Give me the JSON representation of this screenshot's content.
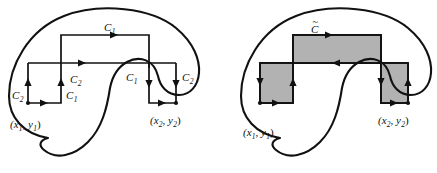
{
  "figure": {
    "width": 437,
    "height": 173,
    "background": "#ffffff",
    "stroke_color": "#111111",
    "shade_color": "#b2b2b2"
  },
  "panels": [
    {
      "id": "left-panel",
      "name": "unshaded-path-panel",
      "description": "Region with two piecewise paths C1 and C2 joining (x1,y1) to (x2,y2)",
      "labels": [
        {
          "id": "top-c1",
          "text": "C",
          "sub": "1",
          "x": 108,
          "y": 32,
          "name": "curve-label-c1-top"
        },
        {
          "id": "mid-c2",
          "text": "C",
          "sub": "2",
          "x": 74,
          "y": 80,
          "name": "curve-label-c2-middle"
        },
        {
          "id": "left-c2",
          "text": "C",
          "sub": "2",
          "x": 14,
          "y": 97,
          "name": "curve-label-c2-left"
        },
        {
          "id": "left-c1",
          "text": "C",
          "sub": "1",
          "x": 61,
          "y": 97,
          "name": "curve-label-c1-left"
        },
        {
          "id": "right-c1",
          "text": "C",
          "sub": "1",
          "x": 128,
          "y": 80,
          "name": "curve-label-c1-right"
        },
        {
          "id": "right-c2",
          "text": "C",
          "sub": "2",
          "x": 181,
          "y": 80,
          "name": "curve-label-c2-right"
        }
      ],
      "points": [
        {
          "id": "p1",
          "text": "(x",
          "sub1": "1",
          "mid": ", y",
          "sub2": "1",
          "close": ")",
          "x": 10,
          "y": 127,
          "name": "point-label-x1y1"
        },
        {
          "id": "p2",
          "text": "(x",
          "sub1": "2",
          "mid": ", y",
          "sub2": "2",
          "close": ")",
          "x": 150,
          "y": 123,
          "name": "point-label-x2y2"
        }
      ]
    },
    {
      "id": "right-panel",
      "name": "shaded-loop-panel",
      "description": "Same region with the closed loop C-tilde and its enclosed area shaded",
      "labels": [
        {
          "id": "ctilde",
          "text": "C",
          "tilde": true,
          "x": 313,
          "y": 33,
          "name": "curve-label-c-tilde"
        }
      ],
      "points": [
        {
          "id": "p1",
          "text": "(x",
          "sub1": "1",
          "mid": ", y",
          "sub2": "1",
          "close": ")",
          "x": 243,
          "y": 135,
          "name": "point-label-x1y1"
        },
        {
          "id": "p2",
          "text": "(x",
          "sub1": "2",
          "mid": ", y",
          "sub2": "2",
          "close": ")",
          "x": 378,
          "y": 123,
          "name": "point-label-x2y2"
        }
      ]
    }
  ],
  "geometry": {
    "left_blob_path": "M 46 137 C 20 132 8 114 10 92 C 12 60 34 26 70 16 C 104 7 150 10 172 28 C 190 43 196 60 196 74 C 196 86 190 95 180 96 C 168 97 160 88 158 78 C 154 62 140 56 128 62 C 118 67 113 76 111 86 C 108 104 104 126 90 140 C 78 152 60 156 46 146 C 40 142 40 139 46 137 Z",
    "right_blob_path": "M 278 137 C 252 132 240 114 242 92 C 244 60 266 26 302 16 C 336 7 382 10 404 28 C 422 43 428 60 428 74 C 428 86 422 95 412 96 C 400 97 392 88 390 78 C 386 62 372 56 360 62 C 350 67 345 76 343 86 C 340 104 336 126 322 140 C 310 152 292 156 278 146 C 272 142 272 139 278 137 Z",
    "left_rect": {
      "x": 28,
      "y": 63,
      "w": 33,
      "h": 40
    },
    "mid_upper_rect": {
      "x": 61,
      "y": 35,
      "w": 88,
      "h": 28
    },
    "right_rect": {
      "x": 149,
      "y": 63,
      "w": 27,
      "h": 40
    },
    "shade_left_rect": {
      "x": 260,
      "y": 63,
      "w": 33,
      "h": 40
    },
    "shade_mid_rect": {
      "x": 293,
      "y": 35,
      "w": 88,
      "h": 28
    },
    "shade_right_rect": {
      "x": 381,
      "y": 63,
      "w": 27,
      "h": 40
    }
  }
}
